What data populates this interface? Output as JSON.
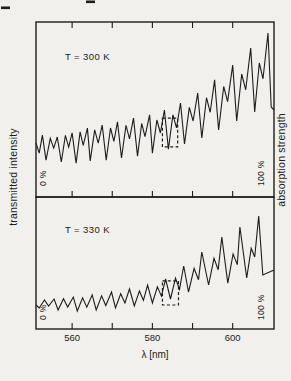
{
  "figure": {
    "background": "#f1f0ec",
    "ink": "#1d1d1d"
  },
  "chart_data": {
    "type": "line",
    "title": "",
    "xlabel": "λ [nm]",
    "ylabel_left": "transmitted intensity",
    "ylabel_right": "absorption strength",
    "x_range": [
      551.0,
      610.3
    ],
    "grid": false,
    "x_ticks": [
      {
        "value": 560,
        "label": "560"
      },
      {
        "value": 570,
        "label": ""
      },
      {
        "value": 580,
        "label": "580"
      },
      {
        "value": 590,
        "label": ""
      },
      {
        "value": 600,
        "label": "600"
      }
    ],
    "panels": [
      {
        "label": "T = 300 K",
        "zero_label": "0 %",
        "hundred_label": "100 %",
        "y_range_pct": [
          0,
          100
        ],
        "highlight_box": {
          "x_nm": [
            582.5,
            586.3
          ],
          "y_pct": [
            28.6,
            45.1
          ]
        },
        "curve": {
          "start": [
            [
              551.0,
              30.9
            ],
            [
              551.8,
              25.1
            ],
            [
              552.6,
              35.4
            ]
          ],
          "troughs": [
            [
              553.5,
              21.1
            ],
            [
              557.3,
              20.0
            ],
            [
              561.0,
              19.4
            ],
            [
              564.5,
              20.6
            ],
            [
              568.5,
              21.1
            ],
            [
              572.3,
              22.3
            ],
            [
              576.3,
              23.4
            ],
            [
              580.0,
              25.1
            ],
            [
              584.0,
              27.4
            ],
            [
              588.0,
              30.3
            ],
            [
              592.3,
              33.7
            ],
            [
              596.5,
              38.3
            ],
            [
              601.0,
              43.4
            ],
            [
              605.5,
              48.6
            ],
            [
              609.6,
              51.4
            ]
          ],
          "mains": [
            [
              556.3,
              34.3
            ],
            [
              560.0,
              36.6
            ],
            [
              563.8,
              39.4
            ],
            [
              567.5,
              41.1
            ],
            [
              571.3,
              42.9
            ],
            [
              575.3,
              45.1
            ],
            [
              579.3,
              46.9
            ],
            [
              583.0,
              49.7
            ],
            [
              587.0,
              53.7
            ],
            [
              591.3,
              59.4
            ],
            [
              595.5,
              66.9
            ],
            [
              600.0,
              75.4
            ],
            [
              604.5,
              85.1
            ],
            [
              608.8,
              93.7
            ]
          ],
          "end": [
            [
              610.3,
              49.7
            ]
          ],
          "shoulder_frac": [
            0.06,
            0.38
          ],
          "dip_frac": [
            0.48,
            0.58
          ]
        }
      },
      {
        "label": "T = 330 K",
        "zero_label": "0 %",
        "hundred_label": "100 %",
        "y_range_pct": [
          0,
          100
        ],
        "highlight_box": {
          "x_nm": [
            582.5,
            586.5
          ],
          "y_pct": [
            18.2,
            36.4
          ]
        },
        "curve": {
          "start": [
            [
              551.0,
              18.2
            ]
          ],
          "troughs": [
            [
              551.8,
              15.9
            ],
            [
              556.5,
              14.4
            ],
            [
              561.3,
              13.6
            ],
            [
              566.0,
              14.4
            ],
            [
              570.8,
              15.9
            ],
            [
              575.5,
              17.4
            ],
            [
              580.0,
              19.7
            ],
            [
              584.5,
              22.7
            ],
            [
              589.0,
              28.0
            ],
            [
              594.0,
              33.3
            ],
            [
              598.8,
              34.8
            ],
            [
              603.5,
              38.6
            ],
            [
              607.5,
              40.9
            ]
          ],
          "mains": [
            [
              555.5,
              22.7
            ],
            [
              560.3,
              24.2
            ],
            [
              565.0,
              25.8
            ],
            [
              569.8,
              28.0
            ],
            [
              574.3,
              30.3
            ],
            [
              578.8,
              33.3
            ],
            [
              583.3,
              37.9
            ],
            [
              587.8,
              47.7
            ],
            [
              592.3,
              58.3
            ],
            [
              597.3,
              69.7
            ],
            [
              601.8,
              77.3
            ],
            [
              606.5,
              85.6
            ]
          ],
          "end": [
            [
              610.3,
              44.7
            ]
          ],
          "shoulder_frac": [
            0.1,
            0.52
          ],
          "dip_frac": [
            0.78,
            0.66
          ]
        }
      }
    ]
  }
}
